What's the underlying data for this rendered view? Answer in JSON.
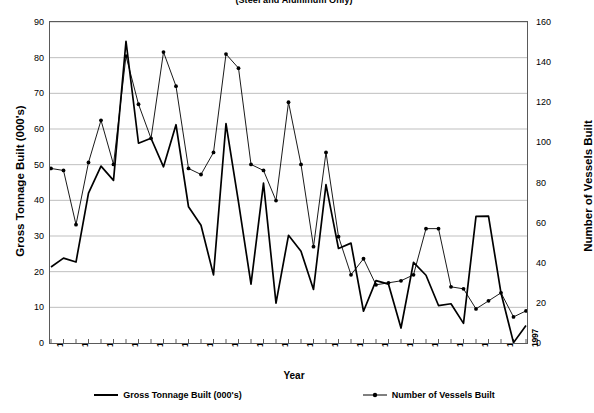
{
  "chart_data": {
    "type": "line",
    "title": "(Steel and Aluminum Only)",
    "xlabel": "Year",
    "ylabel": "Gross Tonnage Built (000's)",
    "y2label": "Number of Vessels Built",
    "ylim": [
      0,
      90
    ],
    "y2lim": [
      0,
      160
    ],
    "ytick_step": 10,
    "y2tick_step": 20,
    "grid": true,
    "legend_position": "bottom",
    "x": [
      1959,
      1960,
      1961,
      1962,
      1963,
      1964,
      1965,
      1966,
      1967,
      1968,
      1969,
      1970,
      1971,
      1972,
      1973,
      1974,
      1975,
      1976,
      1977,
      1978,
      1979,
      1980,
      1981,
      1982,
      1983,
      1984,
      1985,
      1986,
      1987,
      1988,
      1989,
      1990,
      1991,
      1992,
      1993,
      1994,
      1995,
      1996,
      1997
    ],
    "xticklabels": [
      "1959",
      "1961",
      "1963",
      "1965",
      "1967",
      "1969",
      "1971",
      "1973",
      "1975",
      "1977",
      "1979",
      "1981",
      "1983",
      "1985",
      "1987",
      "1989",
      "1991",
      "1993",
      "1995",
      "1997"
    ],
    "yticklabels": [
      "0",
      "10",
      "20",
      "30",
      "40",
      "50",
      "60",
      "70",
      "80",
      "90"
    ],
    "y2ticklabels": [
      "0",
      "20",
      "40",
      "60",
      "80",
      "100",
      "120",
      "140",
      "160"
    ],
    "series": [
      {
        "name": "Gross Tonnage Built (000's)",
        "axis": "left",
        "marker": "none",
        "color": "#000000",
        "values": [
          21.3,
          23.8,
          22.7,
          42.0,
          49.6,
          45.6,
          84.6,
          56.0,
          57.4,
          49.4,
          61.2,
          38.2,
          33.0,
          19.1,
          61.5,
          39.5,
          16.5,
          44.8,
          11.2,
          30.2,
          25.7,
          15.0,
          44.4,
          26.5,
          28.0,
          8.9,
          17.5,
          16.5,
          4.2,
          22.6,
          19.0,
          10.5,
          11.0,
          5.5,
          35.5,
          35.6,
          14.0,
          0.1,
          4.9
        ]
      },
      {
        "name": "Number of Vessels Built",
        "axis": "right",
        "marker": "dot",
        "color": "#000000",
        "values": [
          87,
          86,
          59,
          90,
          111,
          89,
          143,
          119,
          102,
          145,
          128,
          87,
          84,
          95,
          144,
          137,
          89,
          86,
          71,
          120,
          89,
          48,
          95,
          53,
          34,
          42,
          29,
          30,
          31,
          34,
          57,
          57,
          28,
          27,
          17,
          21,
          25,
          13,
          16
        ]
      }
    ]
  }
}
